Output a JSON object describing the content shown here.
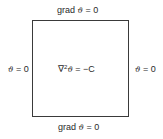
{
  "diagram": {
    "type": "boundary-value-problem",
    "shape": "square",
    "boundaries": {
      "top": {
        "prefix": "grad ",
        "symbol": "ϑ",
        "suffix": " = 0"
      },
      "bottom": {
        "prefix": "grad ",
        "symbol": "ϑ",
        "suffix": " = 0"
      },
      "left": {
        "symbol": "ϑ",
        "suffix": " = 0"
      },
      "right": {
        "symbol": "ϑ",
        "suffix": " = 0"
      }
    },
    "interior": {
      "operator": "∇",
      "exponent": "2",
      "symbol": "ϑ",
      "suffix": " = −C"
    }
  }
}
